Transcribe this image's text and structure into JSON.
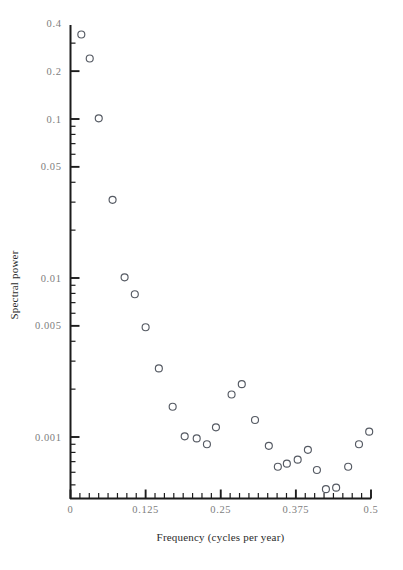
{
  "chart_data": {
    "type": "scatter",
    "title": "",
    "xlabel": "Frequency (cycles per year)",
    "ylabel": "Spectral power",
    "xlim": [
      0,
      0.5
    ],
    "ylim": [
      0.0004,
      0.5
    ],
    "yscale": "log",
    "xscale": "linear",
    "grid": false,
    "legend": null,
    "xticks": [
      0,
      0.125,
      0.25,
      0.375,
      0.5
    ],
    "xticklabels": [
      "0",
      "0.125",
      "0.25",
      "0.375",
      "0.5"
    ],
    "yticks": [
      0.4,
      0.2,
      0.1,
      0.05,
      0.01,
      0.005,
      0.001
    ],
    "yticklabels": [
      "0.4",
      "0.2",
      "0.1",
      "0.05",
      "0.01",
      "0.005",
      "0.001"
    ],
    "x": [
      0.018,
      0.032,
      0.047,
      0.07,
      0.09,
      0.107,
      0.125,
      0.147,
      0.17,
      0.19,
      0.21,
      0.227,
      0.242,
      0.268,
      0.285,
      0.307,
      0.33,
      0.345,
      0.36,
      0.378,
      0.395,
      0.41,
      0.425,
      0.442,
      0.462,
      0.48,
      0.497
    ],
    "y": [
      0.34,
      0.24,
      0.101,
      0.031,
      0.0101,
      0.0079,
      0.0049,
      0.0027,
      0.00155,
      0.00101,
      0.00098,
      0.0009,
      0.00115,
      0.00185,
      0.00215,
      0.00128,
      0.00088,
      0.00065,
      0.00068,
      0.00072,
      0.00083,
      0.00062,
      0.00047,
      0.00048,
      0.00065,
      0.0009,
      0.00108
    ],
    "marker": "open-circle",
    "marker_color": "#555a63",
    "marker_size": 7
  },
  "axes": {
    "y_axis_label": "Spectral power",
    "x_axis_label": "Frequency (cycles per year)"
  }
}
